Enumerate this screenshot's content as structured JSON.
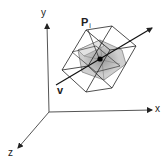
{
  "diagram": {
    "title": "",
    "axes": {
      "x_label": "x",
      "y_label": "y",
      "z_label": "z"
    },
    "point_label": "P",
    "point_subscript": "i",
    "vector_label": "v",
    "colors": {
      "line": "#222222",
      "axis": "#444444",
      "shade_light": "#d4d4d4",
      "shade_dark": "#a8a8a8",
      "background": "#ffffff"
    }
  }
}
